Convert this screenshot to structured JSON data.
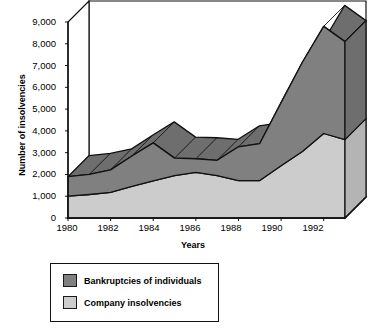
{
  "chart_data": {
    "type": "area",
    "title": "",
    "subtitle": "",
    "xlabel": "Years",
    "ylabel": "Number of insolvencies",
    "stacked": true,
    "three_d": true,
    "grid": false,
    "legend_position": "below-left",
    "xlim": [
      1980,
      1993
    ],
    "ylim": [
      0,
      9000
    ],
    "ytick_step": 1000,
    "x": [
      1980,
      1981,
      1982,
      1983,
      1984,
      1985,
      1986,
      1987,
      1988,
      1989,
      1990,
      1991,
      1992,
      1993
    ],
    "xtick_labels": [
      "1980",
      "1982",
      "1984",
      "1986",
      "1988",
      "1990",
      "1992"
    ],
    "xticks": [
      1980,
      1982,
      1984,
      1986,
      1988,
      1990,
      1992
    ],
    "ytick_labels": [
      "0",
      "1,000",
      "2,000",
      "3,000",
      "4,000",
      "5,000",
      "6,000",
      "7,000",
      "8,000",
      "9,000"
    ],
    "yticks": [
      0,
      1000,
      2000,
      3000,
      4000,
      5000,
      6000,
      7000,
      8000,
      9000
    ],
    "series": [
      {
        "name": "Company insolvencies",
        "color": "#cccccc",
        "order": "bottom",
        "values": [
          1000,
          1080,
          1180,
          1450,
          1700,
          1950,
          2100,
          1950,
          1720,
          1720,
          2400,
          3050,
          3880,
          3600
        ]
      },
      {
        "name": "Bankruptcies of individuals",
        "color": "#808080",
        "order": "top",
        "values": [
          900,
          920,
          1030,
          1400,
          1750,
          800,
          620,
          700,
          1550,
          1700,
          2900,
          4100,
          4920,
          4500
        ]
      }
    ],
    "totals": [
      1900,
      2000,
      2210,
      2850,
      3450,
      2750,
      2720,
      2650,
      3270,
      3420,
      5300,
      7150,
      8800,
      8100
    ]
  },
  "axes": {
    "ylabel": "Number of insolvencies",
    "xlabel": "Years"
  },
  "legend": {
    "items": [
      {
        "label": "Bankruptcies of individuals",
        "color": "#808080"
      },
      {
        "label": "Company insolvencies",
        "color": "#cccccc"
      }
    ]
  },
  "colors": {
    "dark_band": "#808080",
    "light_band": "#cccccc",
    "dark_band_side": "#6e6e6e",
    "light_band_side": "#b4b4b4",
    "outline": "#111111",
    "background": "#ffffff"
  }
}
